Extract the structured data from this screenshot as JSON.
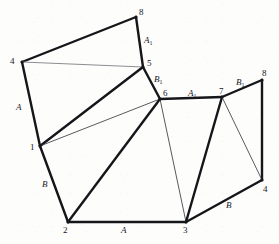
{
  "figure": {
    "colors": {
      "background": "#fdfdfc",
      "edge_thick": "#15161a",
      "edge_thin": "#3a3c42",
      "edge_faint": "#8b8d92",
      "label": "#17181c"
    },
    "vertices": [
      {
        "id": "v8-top",
        "label": "8",
        "x": 136,
        "y": 17,
        "label_x": 139,
        "label_y": 8
      },
      {
        "id": "v4-left",
        "label": "4",
        "x": 22,
        "y": 62,
        "label_x": 10,
        "label_y": 57
      },
      {
        "id": "v5",
        "label": "5",
        "x": 143,
        "y": 67,
        "label_x": 147,
        "label_y": 59
      },
      {
        "id": "v8-right",
        "label": "8",
        "x": 262,
        "y": 80,
        "label_x": 262,
        "label_y": 69
      },
      {
        "id": "v6",
        "label": "6",
        "x": 160,
        "y": 99,
        "label_x": 163,
        "label_y": 89
      },
      {
        "id": "v7",
        "label": "7",
        "x": 222,
        "y": 97,
        "label_x": 219,
        "label_y": 87
      },
      {
        "id": "v1",
        "label": "1",
        "x": 40,
        "y": 146,
        "label_x": 30,
        "label_y": 143
      },
      {
        "id": "v4-right",
        "label": "4",
        "x": 262,
        "y": 180,
        "label_x": 263,
        "label_y": 185
      },
      {
        "id": "v2",
        "label": "2",
        "x": 68,
        "y": 222,
        "label_x": 63,
        "label_y": 226
      },
      {
        "id": "v3",
        "label": "3",
        "x": 186,
        "y": 222,
        "label_x": 183,
        "label_y": 226
      }
    ],
    "edge_labels": [
      {
        "id": "lbl-A1-top",
        "text": "A",
        "sub": "1",
        "x": 144,
        "y": 36,
        "edge": "8-5"
      },
      {
        "id": "lbl-B1-mid",
        "text": "B",
        "sub": "1",
        "x": 154,
        "y": 75,
        "edge": "5-6"
      },
      {
        "id": "lbl-A1-mid",
        "text": "A",
        "sub": "1",
        "x": 188,
        "y": 89,
        "edge": "6-7"
      },
      {
        "id": "lbl-B1-right",
        "text": "B",
        "sub": "1",
        "x": 236,
        "y": 78,
        "edge": "7-8"
      },
      {
        "id": "lbl-A-left",
        "text": "A",
        "sub": "",
        "x": 16,
        "y": 103,
        "edge": "4-1"
      },
      {
        "id": "lbl-B-left",
        "text": "B",
        "sub": "",
        "x": 42,
        "y": 180,
        "edge": "1-2"
      },
      {
        "id": "lbl-A-bottom",
        "text": "A",
        "sub": "",
        "x": 121,
        "y": 226,
        "edge": "2-3"
      },
      {
        "id": "lbl-B-bottom",
        "text": "B",
        "sub": "",
        "x": 226,
        "y": 201,
        "edge": "3-4"
      }
    ],
    "edges": [
      {
        "id": "e-4-8",
        "from": "v4-left",
        "to": "v8-top",
        "weight": "thick",
        "x1": 22,
        "y1": 62,
        "x2": 136,
        "y2": 17
      },
      {
        "id": "e-8-5",
        "from": "v8-top",
        "to": "v5",
        "weight": "thick",
        "x1": 136,
        "y1": 17,
        "x2": 143,
        "y2": 67
      },
      {
        "id": "e-4-5",
        "from": "v4-left",
        "to": "v5",
        "weight": "faint",
        "x1": 22,
        "y1": 62,
        "x2": 143,
        "y2": 67
      },
      {
        "id": "e-4-1",
        "from": "v4-left",
        "to": "v1",
        "weight": "thick",
        "x1": 22,
        "y1": 62,
        "x2": 40,
        "y2": 146
      },
      {
        "id": "e-5-6",
        "from": "v5",
        "to": "v6",
        "weight": "thick",
        "x1": 143,
        "y1": 67,
        "x2": 160,
        "y2": 99
      },
      {
        "id": "e-1-5",
        "from": "v1",
        "to": "v5",
        "weight": "thick",
        "x1": 40,
        "y1": 146,
        "x2": 143,
        "y2": 67
      },
      {
        "id": "e-1-6",
        "from": "v1",
        "to": "v6",
        "weight": "thin",
        "x1": 40,
        "y1": 146,
        "x2": 160,
        "y2": 99
      },
      {
        "id": "e-1-2",
        "from": "v1",
        "to": "v2",
        "weight": "thick",
        "x1": 40,
        "y1": 146,
        "x2": 68,
        "y2": 222
      },
      {
        "id": "e-2-6",
        "from": "v2",
        "to": "v6",
        "weight": "thick",
        "x1": 68,
        "y1": 222,
        "x2": 160,
        "y2": 99
      },
      {
        "id": "e-2-3",
        "from": "v2",
        "to": "v3",
        "weight": "thick",
        "x1": 68,
        "y1": 222,
        "x2": 186,
        "y2": 222
      },
      {
        "id": "e-6-3",
        "from": "v6",
        "to": "v3",
        "weight": "thin",
        "x1": 160,
        "y1": 99,
        "x2": 186,
        "y2": 222
      },
      {
        "id": "e-6-7",
        "from": "v6",
        "to": "v7",
        "weight": "thick",
        "x1": 160,
        "y1": 99,
        "x2": 222,
        "y2": 97
      },
      {
        "id": "e-7-3",
        "from": "v7",
        "to": "v3",
        "weight": "thick",
        "x1": 222,
        "y1": 97,
        "x2": 186,
        "y2": 222
      },
      {
        "id": "e-7-8",
        "from": "v7",
        "to": "v8-right",
        "weight": "thick",
        "x1": 222,
        "y1": 97,
        "x2": 262,
        "y2": 80
      },
      {
        "id": "e-8-4r",
        "from": "v8-right",
        "to": "v4-right",
        "weight": "thick",
        "x1": 262,
        "y1": 80,
        "x2": 262,
        "y2": 180
      },
      {
        "id": "e-7-4r",
        "from": "v7",
        "to": "v4-right",
        "weight": "thin",
        "x1": 222,
        "y1": 97,
        "x2": 262,
        "y2": 180
      },
      {
        "id": "e-3-4r",
        "from": "v3",
        "to": "v4-right",
        "weight": "thick",
        "x1": 186,
        "y1": 222,
        "x2": 262,
        "y2": 180
      }
    ]
  }
}
